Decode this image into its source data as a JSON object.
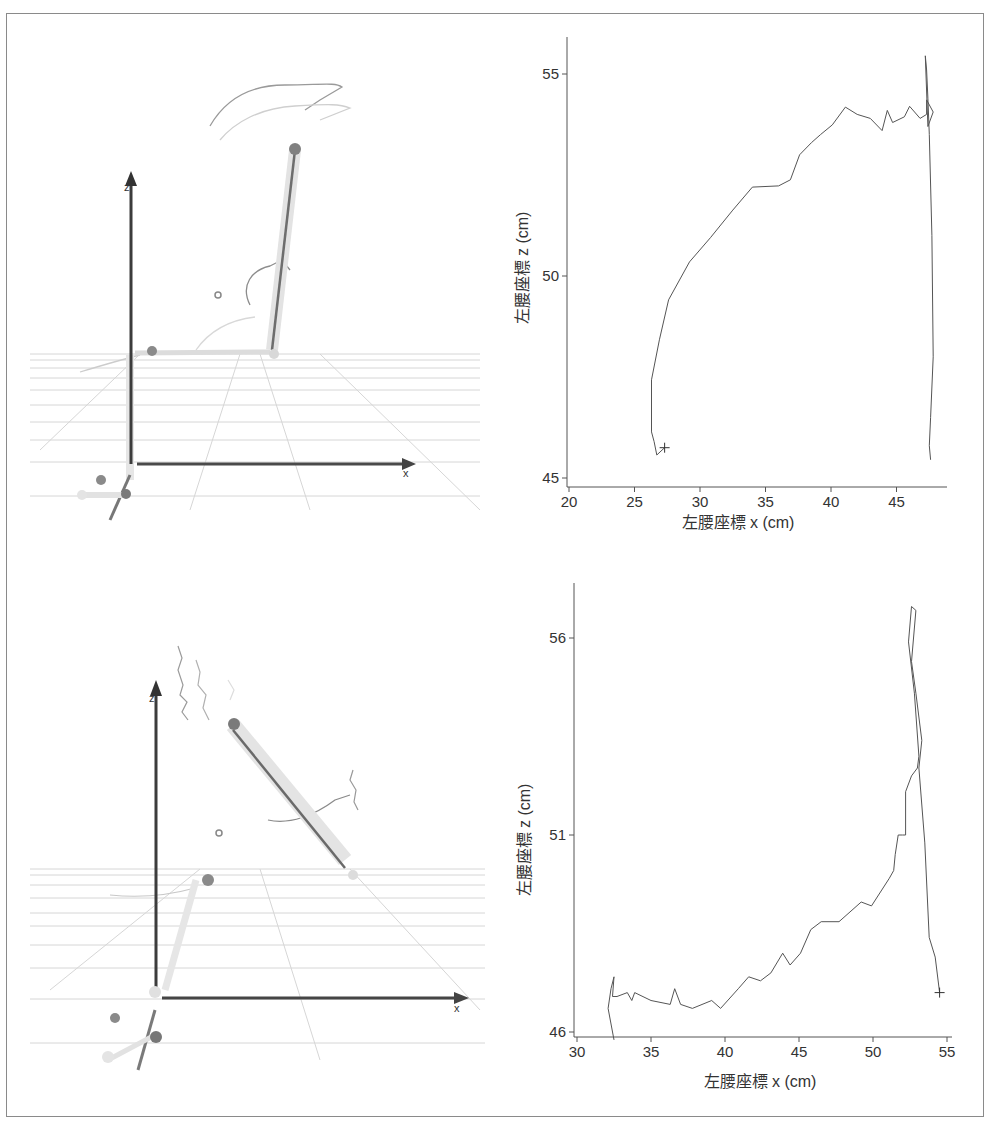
{
  "figure": {
    "border_color": "#8a8a8a",
    "background": "#ffffff"
  },
  "views_3d": [
    {
      "id": "top-left-3d-view",
      "axis_label_x": "x",
      "axis_label_z": "z",
      "description": "3D skeletal motion view with floor grid, trajectories and joint spheres"
    },
    {
      "id": "bottom-left-3d-view",
      "axis_label_x": "x",
      "axis_label_z": "z",
      "description": "3D skeletal motion view with floor grid, trajectories and joint spheres"
    }
  ],
  "chart_data": [
    {
      "type": "line",
      "title": "",
      "xlabel": "左腰座標 x (cm)",
      "ylabel": "左腰座標 z (cm)",
      "xlim": [
        20,
        49
      ],
      "ylim": [
        44.8,
        56.1
      ],
      "xticks": [
        20,
        25,
        30,
        35,
        40,
        45
      ],
      "xtick_labels": [
        "20",
        "25",
        "30",
        "35",
        "40",
        "45"
      ],
      "yticks": [
        45,
        50,
        55
      ],
      "ytick_labels": [
        "45",
        "50",
        "55"
      ],
      "grid": false,
      "legend": null,
      "start_marker": {
        "symbol": "+",
        "x": 27.3,
        "z": 45.75
      },
      "series": [
        {
          "name": "left-hip trajectory",
          "x": [
            27.3,
            26.7,
            26.5,
            26.3,
            26.3,
            26.9,
            27.6,
            29.2,
            30.8,
            32.5,
            34.0,
            36.0,
            36.9,
            37.6,
            38.5,
            39.2,
            40.1,
            41.1,
            42.0,
            43.0,
            43.9,
            44.3,
            44.7,
            45.6,
            46.0,
            46.8,
            47.3,
            47.3,
            47.8,
            47.4,
            47.2,
            47.3,
            47.4,
            47.5,
            47.7,
            47.8,
            47.6,
            47.5,
            47.6
          ],
          "z": [
            45.75,
            45.57,
            45.9,
            46.14,
            47.43,
            48.42,
            49.41,
            50.35,
            50.95,
            51.63,
            52.2,
            52.23,
            52.38,
            53.0,
            53.3,
            53.5,
            53.74,
            54.18,
            54.0,
            53.9,
            53.6,
            54.1,
            53.8,
            53.94,
            54.2,
            53.9,
            54.0,
            54.36,
            54.06,
            53.7,
            55.45,
            55.1,
            54.4,
            53.5,
            51.0,
            48.0,
            46.5,
            45.8,
            45.45
          ]
        }
      ]
    },
    {
      "type": "line",
      "title": "",
      "xlabel": "左腰座標 x (cm)",
      "ylabel": "左腰座標 z (cm)",
      "xlim": [
        30,
        55.5
      ],
      "ylim": [
        45.8,
        57.8
      ],
      "xticks": [
        30,
        35,
        40,
        45,
        50,
        55
      ],
      "xtick_labels": [
        "30",
        "35",
        "40",
        "45",
        "50",
        "55"
      ],
      "yticks": [
        46,
        51,
        56
      ],
      "ytick_labels": [
        "46",
        "51",
        "56"
      ],
      "grid": false,
      "legend": null,
      "end_marker": {
        "symbol": "+",
        "x": 54.5,
        "z": 47.0
      },
      "series": [
        {
          "name": "left-hip trajectory",
          "x": [
            32.5,
            32.1,
            32.3,
            32.5,
            32.4,
            32.7,
            33.4,
            33.7,
            33.9,
            35.0,
            36.3,
            36.6,
            37.0,
            37.8,
            39.1,
            39.7,
            40.9,
            41.6,
            42.4,
            43.1,
            43.9,
            44.4,
            45.1,
            45.8,
            46.5,
            47.7,
            49.2,
            49.9,
            51.1,
            51.4,
            51.5,
            51.7,
            52.0,
            52.2,
            52.2,
            52.6,
            53.0,
            53.1,
            52.8,
            52.4,
            52.6,
            52.9,
            52.6,
            52.9,
            53.3,
            53.1,
            53.5,
            53.8,
            54.2,
            54.5
          ],
          "z": [
            45.8,
            46.6,
            47.1,
            47.4,
            46.9,
            46.9,
            47.0,
            46.8,
            47.0,
            46.8,
            46.7,
            47.1,
            46.7,
            46.6,
            46.8,
            46.6,
            47.1,
            47.4,
            47.3,
            47.5,
            48.0,
            47.7,
            48.0,
            48.6,
            48.8,
            48.8,
            49.3,
            49.2,
            49.9,
            50.1,
            50.5,
            51.0,
            51.0,
            51.0,
            52.1,
            52.5,
            52.7,
            53.0,
            54.6,
            55.9,
            56.8,
            56.7,
            55.4,
            54.6,
            53.4,
            52.7,
            50.8,
            48.4,
            47.9,
            47.0
          ]
        }
      ]
    }
  ]
}
